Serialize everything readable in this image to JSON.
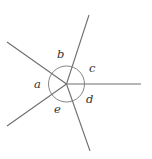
{
  "diagram": {
    "type": "angles-around-a-point",
    "center": [
      66.5,
      84
    ],
    "circle_radius": 18,
    "rays": [
      {
        "name": "ray-upper-right",
        "end": [
          89,
          15
        ]
      },
      {
        "name": "ray-right",
        "end": [
          141,
          84
        ]
      },
      {
        "name": "ray-lower-right",
        "end": [
          90,
          151
        ]
      },
      {
        "name": "ray-lower-left",
        "end": [
          7,
          126
        ]
      },
      {
        "name": "ray-upper-left",
        "end": [
          7,
          42
        ]
      }
    ],
    "angle_labels": [
      {
        "text": "a",
        "pos": [
          34,
          88
        ]
      },
      {
        "text": "b",
        "pos": [
          57,
          58
        ]
      },
      {
        "text": "c",
        "pos": [
          89,
          72
        ]
      },
      {
        "text": "d",
        "pos": [
          86,
          103
        ]
      },
      {
        "text": "e",
        "pos": [
          54,
          113
        ]
      }
    ],
    "colors": {
      "line": "#6e6e6e",
      "text": "#333333",
      "background": "#ffffff"
    }
  }
}
